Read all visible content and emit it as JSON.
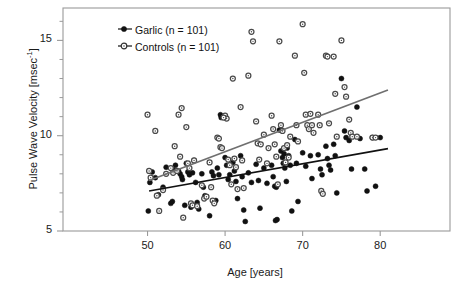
{
  "chart_data": {
    "type": "scatter",
    "title": "",
    "xlabel": "Age [years]",
    "ylabel_text": "Pulse Wave Velocity [msec",
    "ylabel_sup": "-1",
    "ylabel_tail": "]",
    "xlim": [
      39.1,
      89.0
    ],
    "ylim": [
      5.0,
      16.7
    ],
    "xticks": [
      50,
      60,
      70,
      80
    ],
    "xtick_labels": [
      "50",
      "60",
      "70",
      "80"
    ],
    "yticks": [
      5,
      10,
      15
    ],
    "ytick_labels": [
      "5",
      "10",
      "15"
    ],
    "yminor_ticks": [
      6,
      7,
      8,
      9,
      11,
      12,
      13,
      14,
      16
    ],
    "grid": false,
    "legend_position": "top-left",
    "frame_color": "#9a9a9a",
    "series": [
      {
        "name": "Garlic (n = 101)",
        "label": "Garlic",
        "n": 101,
        "marker": "filled-circle",
        "color": "#111111",
        "trend_color": "#111111",
        "trend": {
          "x0": 50.2,
          "y0": 7.1,
          "x1": 81.0,
          "y1": 9.32
        },
        "points": [
          [
            50.1,
            6.05
          ],
          [
            50.3,
            7.55
          ],
          [
            50.6,
            8.1
          ],
          [
            51.0,
            7.8
          ],
          [
            51.4,
            6.9
          ],
          [
            52.0,
            7.3
          ],
          [
            52.4,
            8.35
          ],
          [
            53.0,
            6.45
          ],
          [
            53.2,
            6.55
          ],
          [
            53.4,
            8.2
          ],
          [
            53.6,
            8.45
          ],
          [
            54.0,
            8.15
          ],
          [
            54.2,
            8.0
          ],
          [
            54.4,
            7.85
          ],
          [
            54.5,
            7.7
          ],
          [
            54.8,
            6.35
          ],
          [
            55.0,
            8.55
          ],
          [
            55.2,
            8.1
          ],
          [
            55.4,
            7.95
          ],
          [
            55.6,
            6.25
          ],
          [
            56.0,
            8.7
          ],
          [
            56.2,
            7.55
          ],
          [
            56.4,
            6.5
          ],
          [
            56.6,
            6.15
          ],
          [
            57.0,
            8.0
          ],
          [
            57.2,
            7.3
          ],
          [
            57.4,
            6.85
          ],
          [
            58.0,
            5.8
          ],
          [
            58.3,
            8.1
          ],
          [
            58.5,
            7.9
          ],
          [
            58.8,
            6.6
          ],
          [
            59.0,
            8.3
          ],
          [
            59.2,
            7.95
          ],
          [
            59.4,
            11.1
          ],
          [
            59.5,
            10.95
          ],
          [
            60.0,
            8.85
          ],
          [
            60.2,
            8.45
          ],
          [
            60.4,
            7.7
          ],
          [
            61.0,
            8.6
          ],
          [
            61.2,
            8.15
          ],
          [
            61.4,
            7.6
          ],
          [
            61.6,
            6.7
          ],
          [
            62.0,
            8.95
          ],
          [
            62.2,
            7.85
          ],
          [
            62.4,
            6.1
          ],
          [
            62.6,
            5.5
          ],
          [
            63.0,
            8.05
          ],
          [
            63.4,
            7.55
          ],
          [
            64.0,
            8.5
          ],
          [
            64.3,
            7.65
          ],
          [
            64.5,
            6.2
          ],
          [
            65.0,
            8.3
          ],
          [
            65.4,
            7.5
          ],
          [
            66.0,
            8.45
          ],
          [
            66.2,
            7.85
          ],
          [
            66.4,
            7.35
          ],
          [
            66.5,
            5.55
          ],
          [
            66.7,
            5.6
          ],
          [
            67.0,
            10.3
          ],
          [
            67.2,
            9.2
          ],
          [
            67.4,
            8.85
          ],
          [
            67.5,
            8.55
          ],
          [
            67.7,
            8.3
          ],
          [
            67.9,
            7.6
          ],
          [
            68.0,
            9.35
          ],
          [
            68.2,
            8.95
          ],
          [
            68.4,
            8.45
          ],
          [
            68.6,
            6.05
          ],
          [
            69.0,
            9.8
          ],
          [
            69.2,
            8.55
          ],
          [
            69.4,
            6.55
          ],
          [
            70.0,
            9.1
          ],
          [
            70.4,
            8.4
          ],
          [
            71.0,
            8.95
          ],
          [
            71.2,
            7.75
          ],
          [
            72.0,
            9.0
          ],
          [
            72.3,
            8.25
          ],
          [
            72.5,
            7.95
          ],
          [
            73.0,
            9.45
          ],
          [
            73.2,
            8.8
          ],
          [
            73.4,
            8.45
          ],
          [
            73.6,
            8.2
          ],
          [
            74.0,
            9.55
          ],
          [
            74.2,
            8.95
          ],
          [
            74.4,
            7.0
          ],
          [
            75.0,
            13.0
          ],
          [
            75.4,
            10.25
          ],
          [
            75.6,
            9.9
          ],
          [
            76.0,
            9.75
          ],
          [
            76.3,
            8.25
          ],
          [
            77.0,
            11.5
          ],
          [
            77.4,
            9.85
          ],
          [
            78.0,
            8.25
          ],
          [
            78.3,
            7.1
          ],
          [
            79.0,
            9.9
          ],
          [
            79.4,
            7.35
          ],
          [
            80.0,
            9.9
          ],
          [
            66.6,
            7.3
          ],
          [
            67.6,
            9.05
          ],
          [
            60.6,
            7.95
          ],
          [
            55.8,
            8.05
          ]
        ]
      },
      {
        "name": "Controls (n = 101)",
        "label": "Controls",
        "n": 101,
        "marker": "open-circle",
        "color": "#555555",
        "trend_color": "#6f6f6f",
        "trend": {
          "x0": 50.2,
          "y0": 7.65,
          "x1": 81.0,
          "y1": 12.4
        },
        "points": [
          [
            50.0,
            11.1
          ],
          [
            50.2,
            8.15
          ],
          [
            50.4,
            7.8
          ],
          [
            51.0,
            10.25
          ],
          [
            51.2,
            6.85
          ],
          [
            51.5,
            6.05
          ],
          [
            52.0,
            7.15
          ],
          [
            52.4,
            8.0
          ],
          [
            53.0,
            8.3
          ],
          [
            53.3,
            8.05
          ],
          [
            53.5,
            9.45
          ],
          [
            54.0,
            11.1
          ],
          [
            54.2,
            8.9
          ],
          [
            54.4,
            11.45
          ],
          [
            54.6,
            5.7
          ],
          [
            55.0,
            10.45
          ],
          [
            55.2,
            8.55
          ],
          [
            55.4,
            8.3
          ],
          [
            55.6,
            6.45
          ],
          [
            55.8,
            6.35
          ],
          [
            56.0,
            8.7
          ],
          [
            56.4,
            6.3
          ],
          [
            57.0,
            7.4
          ],
          [
            57.3,
            6.7
          ],
          [
            57.6,
            6.8
          ],
          [
            58.0,
            8.6
          ],
          [
            58.2,
            7.3
          ],
          [
            58.4,
            6.6
          ],
          [
            58.6,
            6.45
          ],
          [
            59.0,
            9.9
          ],
          [
            59.2,
            9.85
          ],
          [
            59.4,
            9.4
          ],
          [
            59.6,
            9.35
          ],
          [
            60.0,
            11.05
          ],
          [
            60.2,
            10.9
          ],
          [
            60.4,
            8.75
          ],
          [
            60.6,
            8.45
          ],
          [
            60.8,
            7.45
          ],
          [
            61.0,
            13.0
          ],
          [
            61.2,
            8.8
          ],
          [
            61.4,
            8.35
          ],
          [
            61.6,
            7.2
          ],
          [
            62.0,
            11.5
          ],
          [
            62.2,
            8.7
          ],
          [
            62.4,
            7.25
          ],
          [
            63.0,
            13.15
          ],
          [
            63.4,
            15.45
          ],
          [
            63.6,
            14.95
          ],
          [
            64.0,
            10.75
          ],
          [
            64.2,
            9.6
          ],
          [
            64.4,
            8.75
          ],
          [
            65.0,
            10.05
          ],
          [
            65.4,
            8.55
          ],
          [
            66.0,
            11.05
          ],
          [
            66.2,
            10.35
          ],
          [
            66.4,
            9.55
          ],
          [
            66.6,
            8.9
          ],
          [
            66.8,
            7.45
          ],
          [
            67.0,
            14.95
          ],
          [
            67.2,
            10.55
          ],
          [
            67.4,
            10.25
          ],
          [
            67.6,
            9.35
          ],
          [
            67.8,
            8.6
          ],
          [
            68.0,
            9.5
          ],
          [
            68.2,
            8.85
          ],
          [
            69.0,
            14.2
          ],
          [
            69.2,
            10.55
          ],
          [
            69.4,
            9.7
          ],
          [
            70.0,
            15.85
          ],
          [
            70.2,
            13.3
          ],
          [
            70.4,
            11.1
          ],
          [
            70.6,
            10.55
          ],
          [
            70.8,
            10.35
          ],
          [
            71.0,
            11.15
          ],
          [
            71.4,
            10.15
          ],
          [
            72.0,
            11.1
          ],
          [
            72.2,
            10.55
          ],
          [
            72.4,
            7.1
          ],
          [
            72.6,
            6.95
          ],
          [
            73.0,
            14.2
          ],
          [
            73.2,
            14.15
          ],
          [
            73.4,
            10.65
          ],
          [
            74.0,
            14.15
          ],
          [
            74.2,
            12.2
          ],
          [
            74.4,
            9.95
          ],
          [
            75.0,
            15.0
          ],
          [
            75.4,
            12.55
          ],
          [
            75.6,
            12.05
          ],
          [
            76.0,
            10.85
          ],
          [
            76.2,
            10.15
          ],
          [
            76.4,
            9.95
          ],
          [
            77.0,
            9.95
          ],
          [
            79.0,
            9.9
          ],
          [
            79.4,
            9.9
          ],
          [
            64.6,
            9.55
          ],
          [
            65.6,
            9.35
          ],
          [
            68.4,
            9.95
          ],
          [
            71.2,
            10.55
          ],
          [
            59.8,
            10.95
          ],
          [
            53.8,
            8.15
          ]
        ]
      }
    ]
  },
  "legend": {
    "entries": [
      {
        "label": "Garlic (n = 101)",
        "marker": "filled-circle"
      },
      {
        "label": "Controls (n = 101)",
        "marker": "open-circle"
      }
    ]
  }
}
